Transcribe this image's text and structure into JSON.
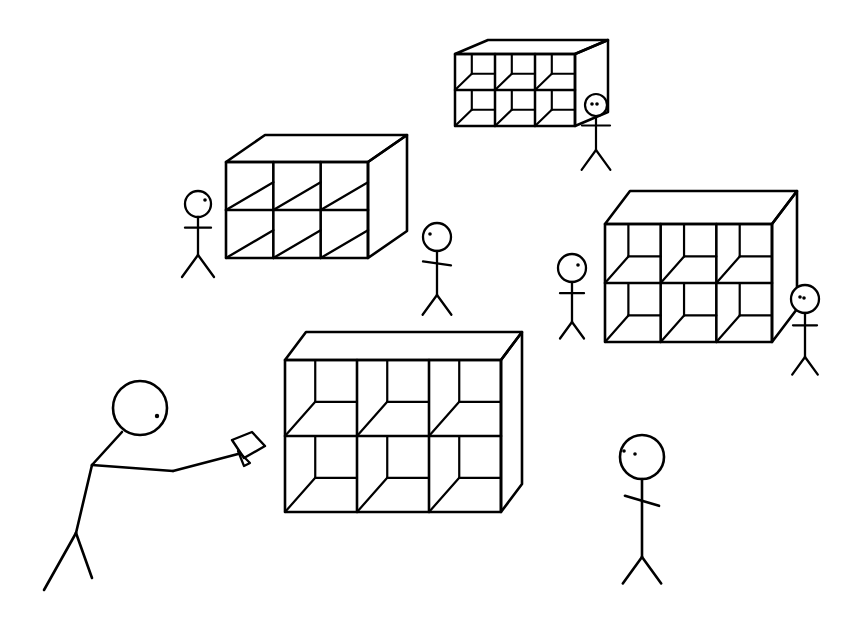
{
  "scene": {
    "title": "Stick figures near cubby shelving units",
    "ink_color": "#000000",
    "background_color": "#ffffff"
  },
  "shelves": [
    {
      "id": "shelf-top-small",
      "rows": 2,
      "columns": 3,
      "style": "back-panel"
    },
    {
      "id": "shelf-upper-left",
      "rows": 2,
      "columns": 3,
      "style": "diagonal-floor"
    },
    {
      "id": "shelf-right",
      "rows": 2,
      "columns": 3,
      "style": "back-panel"
    },
    {
      "id": "shelf-center-large",
      "rows": 2,
      "columns": 3,
      "style": "back-panel"
    }
  ],
  "figures": [
    {
      "id": "figure-top-right-small",
      "pose": "standing",
      "eyes": 2
    },
    {
      "id": "figure-upper-left",
      "pose": "standing",
      "eyes": 1
    },
    {
      "id": "figure-center",
      "pose": "standing",
      "eyes": 1
    },
    {
      "id": "figure-right-left-of-shelf",
      "pose": "standing",
      "eyes": 1
    },
    {
      "id": "figure-right-far",
      "pose": "standing",
      "eyes": 2
    },
    {
      "id": "figure-foreground-left",
      "pose": "reaching-with-card",
      "eyes": 1
    },
    {
      "id": "figure-foreground-right",
      "pose": "standing",
      "eyes": 2
    }
  ],
  "held_item": {
    "id": "card",
    "held_by": "figure-foreground-left"
  }
}
